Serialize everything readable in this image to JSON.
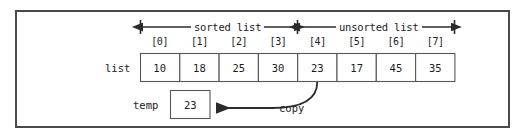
{
  "figure": {
    "kind": "insertion-sort-step-diagram",
    "frame": {
      "border_color": "#4a4a4a",
      "background": "#ffffff"
    },
    "line_color": "#2b2b2b",
    "text_color": "#1c1c1c"
  },
  "array": {
    "name_label": "list",
    "indices": [
      "[0]",
      "[1]",
      "[2]",
      "[3]",
      "[4]",
      "[5]",
      "[6]",
      "[7]"
    ],
    "values": [
      "10",
      "18",
      "25",
      "30",
      "23",
      "17",
      "45",
      "35"
    ]
  },
  "regions": [
    {
      "label": "sorted list",
      "start_index": 0,
      "end_index": 3
    },
    {
      "label": "unsorted list",
      "start_index": 4,
      "end_index": 7
    }
  ],
  "temp": {
    "name_label": "temp",
    "value": "23"
  },
  "annotation": {
    "arrow_label": "copy",
    "from_index": "[4]",
    "to": "temp"
  }
}
